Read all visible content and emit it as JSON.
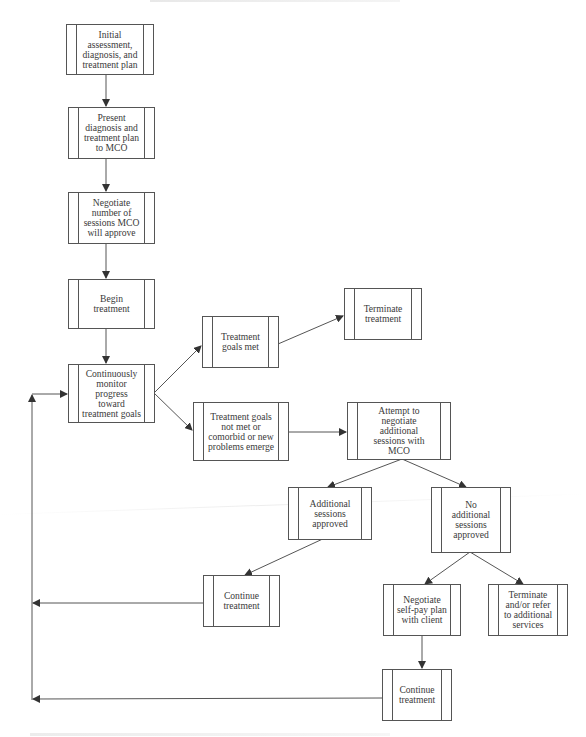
{
  "diagram": {
    "type": "flowchart",
    "nodes": {
      "initial": {
        "label": "Initial\nassessment,\ndiagnosis, and\ntreatment plan"
      },
      "present": {
        "label": "Present\ndiagnosis and\ntreatment plan\nto MCO"
      },
      "negotiate": {
        "label": "Negotiate\nnumber of\nsessions MCO\nwill approve"
      },
      "begin": {
        "label": "Begin\ntreatment"
      },
      "monitor": {
        "label": "Continuously\nmonitor\nprogress\ntoward\ntreatment goals"
      },
      "goals_met": {
        "label": "Treatment\ngoals met"
      },
      "terminate": {
        "label": "Terminate\ntreatment"
      },
      "goals_not_met": {
        "label": "Treatment goals\nnot met or\ncomorbid or new\nproblems emerge"
      },
      "attempt": {
        "label": "Attempt to\nnegotiate\nadditional\nsessions with\nMCO"
      },
      "approved": {
        "label": "Additional\nsessions\napproved"
      },
      "not_approved": {
        "label": "No\nadditional\nsessions\napproved"
      },
      "continue_left": {
        "label": "Continue\ntreatment"
      },
      "self_pay": {
        "label": "Negotiate\nself-pay plan\nwith client"
      },
      "terminate_refer": {
        "label": "Terminate\nand/or refer\nto additional\nservices"
      },
      "continue_bottom": {
        "label": "Continue\ntreatment"
      }
    },
    "edges": [
      [
        "initial",
        "present"
      ],
      [
        "present",
        "negotiate"
      ],
      [
        "negotiate",
        "begin"
      ],
      [
        "begin",
        "monitor"
      ],
      [
        "monitor",
        "goals_met"
      ],
      [
        "monitor",
        "goals_not_met"
      ],
      [
        "goals_met",
        "terminate"
      ],
      [
        "goals_not_met",
        "attempt"
      ],
      [
        "attempt",
        "approved"
      ],
      [
        "attempt",
        "not_approved"
      ],
      [
        "approved",
        "continue_left"
      ],
      [
        "not_approved",
        "self_pay"
      ],
      [
        "not_approved",
        "terminate_refer"
      ],
      [
        "self_pay",
        "continue_bottom"
      ],
      [
        "continue_left",
        "monitor"
      ],
      [
        "continue_bottom",
        "monitor"
      ]
    ],
    "colors": {
      "stroke": "#555555",
      "text": "#3a3a3a",
      "background": "#ffffff"
    }
  }
}
